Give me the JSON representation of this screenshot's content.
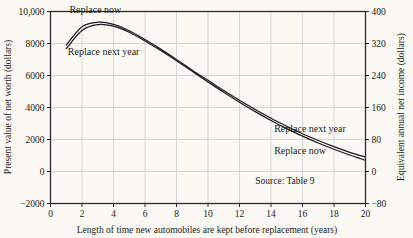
{
  "chart_data": {
    "type": "line",
    "title": "",
    "xlabel": "Length of time new automobiles are kept before replacement (years)",
    "ylabel": "Present value of net worth (dollars)",
    "y2label": "Equivalent annual net income (dollars)",
    "xlim": [
      0,
      20
    ],
    "ylim": [
      -2000,
      10000
    ],
    "y2lim": [
      -80,
      400
    ],
    "grid": true,
    "legend_position": "inline-annotations",
    "xticks": [
      "0",
      "2",
      "4",
      "6",
      "8",
      "10",
      "12",
      "14",
      "16",
      "18",
      "20"
    ],
    "xtick_values": [
      0,
      2,
      4,
      6,
      8,
      10,
      12,
      14,
      16,
      18,
      20
    ],
    "yticks": [
      "−2000",
      "0",
      "2000",
      "4000",
      "6000",
      "8000",
      "10,000"
    ],
    "ytick_values": [
      -2000,
      0,
      2000,
      4000,
      6000,
      8000,
      10000
    ],
    "y2ticks": [
      "−80",
      "0",
      "80",
      "160",
      "240",
      "320",
      "400"
    ],
    "y2tick_values": [
      -80,
      0,
      80,
      160,
      240,
      320,
      400
    ],
    "x": [
      1,
      2,
      3,
      4,
      5,
      6,
      7,
      8,
      9,
      10,
      11,
      12,
      13,
      14,
      15,
      16,
      17,
      18,
      19,
      20
    ],
    "series": [
      {
        "name": "Replace now",
        "values": [
          7900,
          9050,
          9330,
          9200,
          8800,
          8250,
          7650,
          7000,
          6330,
          5700,
          5060,
          4450,
          3880,
          3330,
          2830,
          2360,
          1940,
          1550,
          1200,
          900
        ]
      },
      {
        "name": "Replace next year",
        "values": [
          7680,
          8820,
          9180,
          9080,
          8700,
          8160,
          7560,
          6920,
          6260,
          5600,
          4950,
          4330,
          3740,
          3190,
          2680,
          2210,
          1780,
          1390,
          1030,
          700
        ]
      }
    ],
    "annotations": [
      {
        "text": "Replace now",
        "x_data": 1.2,
        "y_data": 9900,
        "anchor": "start"
      },
      {
        "text": "Replace next year",
        "x_data": 1.1,
        "y_data": 7300,
        "anchor": "start"
      },
      {
        "text": "Replace next year",
        "x_data": 14.2,
        "y_data": 2450,
        "anchor": "start"
      },
      {
        "text": "Replace now",
        "x_data": 14.2,
        "y_data": 1080,
        "anchor": "start"
      },
      {
        "text": "Source: Table 9",
        "x_data": 13.0,
        "y_data": -780,
        "anchor": "start"
      }
    ],
    "colors": {
      "curve": "#1c1c1c",
      "grid": "#c9c9c9",
      "frame": "#2b2b2b",
      "background": "#fbf9f4",
      "text": "#1b1b1b"
    }
  }
}
